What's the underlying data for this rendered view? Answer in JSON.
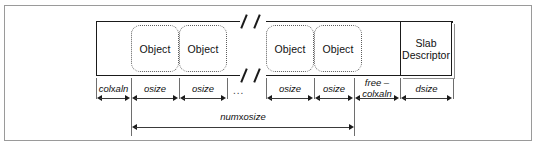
{
  "figure": {
    "colors": {
      "frame": "#9a9a9a",
      "bar_border": "#1a1a1a",
      "object_border": "#5d5d5d",
      "arrow": "#1a1a1a",
      "text": "#111111"
    }
  },
  "slab": {
    "objects": [
      {
        "label": "Object"
      },
      {
        "label": "Object"
      },
      {
        "label": "Object"
      },
      {
        "label": "Object"
      }
    ],
    "descriptor": {
      "line1": "Slab",
      "line2": "Descriptor"
    },
    "break_marker": "//"
  },
  "dimensions": {
    "coloring": {
      "prefix": "col",
      "operator": "x",
      "suffix": "aln"
    },
    "osize": "osize",
    "ellipsis": "...",
    "free": {
      "line1": "free –",
      "prefix": "col",
      "operator": "x",
      "suffix": "aln"
    },
    "dsize": "dsize",
    "total": {
      "prefix": "num",
      "operator": "x",
      "suffix": "osize"
    }
  }
}
